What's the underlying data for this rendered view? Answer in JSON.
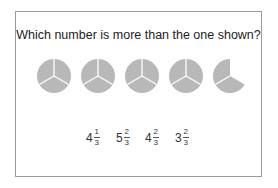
{
  "question": "Which number is more than the one shown?",
  "shown": {
    "whole_circles": 4,
    "partial_sectors": 2,
    "sectors_per_circle": 3,
    "fill_color": "#b8b8b8"
  },
  "options": [
    {
      "whole": "4",
      "num": "1",
      "den": "3"
    },
    {
      "whole": "5",
      "num": "2",
      "den": "3"
    },
    {
      "whole": "4",
      "num": "2",
      "den": "3"
    },
    {
      "whole": "3",
      "num": "2",
      "den": "3"
    }
  ]
}
